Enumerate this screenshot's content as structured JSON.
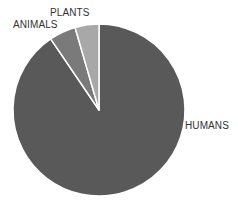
{
  "chart_data": {
    "type": "pie",
    "title": "",
    "categories": [
      "HUMANS",
      "ANIMALS",
      "PLANTS"
    ],
    "values": [
      90.5,
      5,
      4.5
    ],
    "colors": [
      "#595959",
      "#7a7a7a",
      "#a8a8a8"
    ],
    "start_angle_deg": 0,
    "direction": "clockwise",
    "legend": "none",
    "labels_position": "outside"
  },
  "labels": {
    "humans": "HUMANS",
    "animals": "ANIMALS",
    "plants": "PLANTS"
  }
}
